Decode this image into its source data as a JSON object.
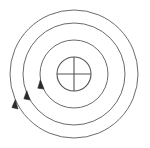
{
  "diagram": {
    "type": "bohr-atom-shell-diagram",
    "canvas": {
      "width": 150,
      "height": 148,
      "background": "#ffffff"
    },
    "colors": {
      "shell_stroke": "#6b6b6b",
      "nucleus_stroke": "#555555",
      "crosshair_stroke": "#555555",
      "arrow_fill": "#2b2b2b",
      "background": "#ffffff"
    },
    "center": {
      "x": 74,
      "y": 74
    },
    "nucleus": {
      "label": "nucleus",
      "radius": 17,
      "stroke_width": 1.1,
      "crosshair": {
        "label": "crosshair",
        "horizontal": {
          "x1": 57,
          "y1": 74,
          "x2": 91,
          "y2": 74
        },
        "vertical": {
          "x1": 74,
          "y1": 57,
          "x2": 74,
          "y2": 91
        },
        "stroke_width": 1.1
      }
    },
    "shells": [
      {
        "name": "shell-1",
        "radius": 34,
        "stroke_width": 1.0
      },
      {
        "name": "shell-2",
        "radius": 51,
        "stroke_width": 1.0
      },
      {
        "name": "shell-3",
        "radius": 64,
        "stroke_width": 1.0
      }
    ],
    "arrows": [
      {
        "name": "direction-arrow-shell-1",
        "shell": "shell-1",
        "tip": {
          "x": 44,
          "y": 89
        },
        "angle_deg": 225,
        "size": 9
      },
      {
        "name": "direction-arrow-shell-2",
        "shell": "shell-2",
        "tip": {
          "x": 30,
          "y": 100
        },
        "angle_deg": 228,
        "size": 9
      },
      {
        "name": "direction-arrow-shell-3",
        "shell": "shell-3",
        "tip": {
          "x": 18,
          "y": 109
        },
        "angle_deg": 231,
        "size": 9
      }
    ]
  }
}
